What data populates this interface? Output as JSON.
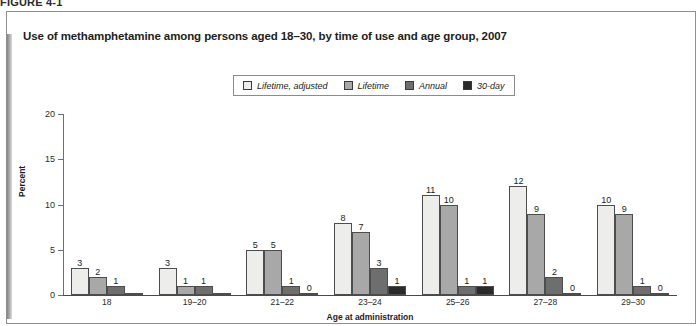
{
  "figure": {
    "number_label": "FIGURE 4-1"
  },
  "chart_data": {
    "type": "bar",
    "title": "Use of methamphetamine among persons aged 18–30, by time of use and age group, 2007",
    "xlabel": "Age at administration",
    "ylabel": "Percent",
    "ylim": [
      0,
      20
    ],
    "yticks": [
      0,
      5,
      10,
      15,
      20
    ],
    "grid": false,
    "legend_position": "top-center",
    "categories": [
      "18",
      "19–20",
      "21–22",
      "23–24",
      "25–26",
      "27–28",
      "29–30"
    ],
    "series": [
      {
        "name": "Lifetime, adjusted",
        "color": "#ededeb",
        "values": [
          3,
          3,
          5,
          8,
          11,
          12,
          10
        ],
        "labels": [
          "3",
          "3",
          "5",
          "8",
          "11",
          "12",
          "10"
        ]
      },
      {
        "name": "Lifetime",
        "color": "#a8a8a8",
        "values": [
          2,
          1,
          5,
          7,
          10,
          9,
          9
        ],
        "labels": [
          "2",
          "1",
          "5",
          "7",
          "10",
          "9",
          "9"
        ]
      },
      {
        "name": "Annual",
        "color": "#6e6e6e",
        "values": [
          1,
          1,
          1,
          3,
          1,
          2,
          1
        ],
        "labels": [
          "1",
          "1",
          "1",
          "3",
          "1",
          "2",
          "1"
        ]
      },
      {
        "name": "30-day",
        "color": "#2a2a2a",
        "values": [
          0.12,
          0.12,
          0.12,
          1,
          1,
          0.12,
          0.12
        ],
        "labels": [
          "",
          "",
          "0",
          "1",
          "1",
          "0",
          "0"
        ]
      }
    ]
  },
  "colors": {
    "panel_border": "#8e8e8e",
    "axis": "#4a4a4a",
    "text": "#1d1d1d"
  }
}
